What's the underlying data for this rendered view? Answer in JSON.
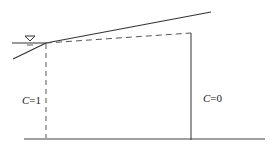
{
  "diagram": {
    "labels": {
      "left_region": {
        "var": "C",
        "eq": "=1"
      },
      "right_region": {
        "var": "C",
        "eq": "=0"
      }
    },
    "symbols": {
      "water_level": "water-table-triangle"
    },
    "colors": {
      "line": "#333333",
      "dashed": "#555555"
    }
  }
}
